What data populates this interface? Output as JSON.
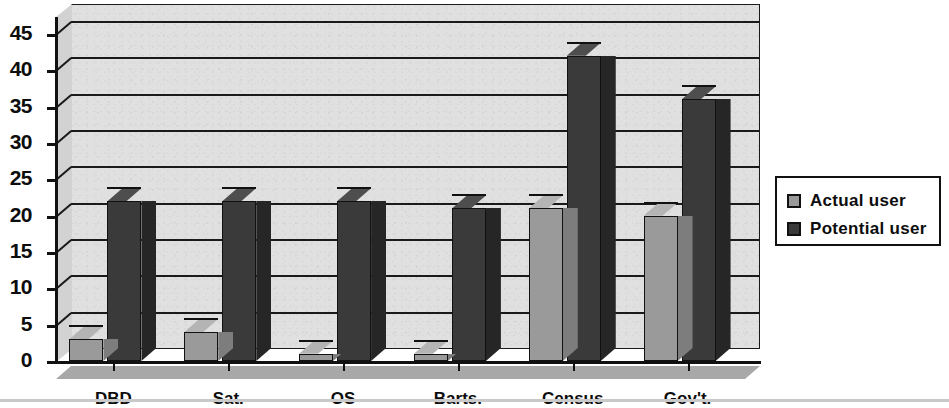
{
  "chart_data": {
    "type": "bar",
    "title": "",
    "subtitle": "",
    "xlabel": "",
    "ylabel": "",
    "categories": [
      "DBD",
      "Sat.",
      "OS",
      "Barts.",
      "Census",
      "Gov't."
    ],
    "series": [
      {
        "name": "Actual user",
        "values": [
          3,
          4,
          1,
          1,
          21,
          20
        ],
        "color": "#9a9a9a"
      },
      {
        "name": "Potential user",
        "values": [
          22,
          22,
          22,
          21,
          42,
          36
        ],
        "color": "#3a3a3a"
      }
    ],
    "ylim": [
      0,
      45
    ],
    "ytick_values": [
      0,
      5,
      10,
      15,
      20,
      25,
      30,
      35,
      40,
      45
    ],
    "ytick_labels": [
      "0",
      "5",
      "10",
      "15",
      "20",
      "25",
      "30",
      "35",
      "40",
      "45"
    ],
    "grid": true,
    "grid_axis": "y",
    "legend_position": "right",
    "style": "3d-grouped-bar-grayscale"
  },
  "legend": {
    "entries": [
      {
        "label": "Actual user",
        "swatch": "light-gray-swatch"
      },
      {
        "label": "Potential user",
        "swatch": "dark-gray-swatch"
      }
    ]
  },
  "colors": {
    "series_actual": "#9a9a9a",
    "series_potential": "#3a3a3a",
    "plot_background": "#e0e0e0",
    "floor": "#a8a8a8",
    "axis": "#111111",
    "page_background": "#ffffff"
  }
}
